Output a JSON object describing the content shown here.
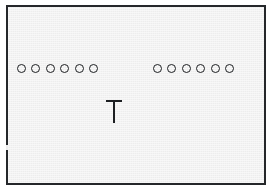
{
  "figure": {
    "background_color": "#ededed",
    "page_color": "#ffffff",
    "ink_color": "#1d1f22",
    "frame": {
      "border_color": "#25272a",
      "border_width_px": 2,
      "x": 6,
      "y": 5,
      "width": 260,
      "height": 180
    },
    "groups": [
      {
        "name": "left-group",
        "shape": "circle-outline",
        "count": 6,
        "x": 15,
        "y": 62,
        "diameter_px": 9,
        "spacing_px": 14.4,
        "items": [
          {
            "index": 1,
            "label": "o"
          },
          {
            "index": 2,
            "label": "o"
          },
          {
            "index": 3,
            "label": "o"
          },
          {
            "index": 4,
            "label": "o"
          },
          {
            "index": 5,
            "label": "o"
          },
          {
            "index": 6,
            "label": "o"
          }
        ]
      },
      {
        "name": "right-group",
        "shape": "circle-outline",
        "count": 6,
        "x": 151,
        "y": 62,
        "diameter_px": 9,
        "spacing_px": 14.4,
        "items": [
          {
            "index": 1,
            "label": "o"
          },
          {
            "index": 2,
            "label": "o"
          },
          {
            "index": 3,
            "label": "o"
          },
          {
            "index": 4,
            "label": "o"
          },
          {
            "index": 5,
            "label": "o"
          },
          {
            "index": 6,
            "label": "o"
          }
        ]
      }
    ],
    "gap": {
      "name": "center-gap",
      "x": 111,
      "width_px": 40
    },
    "probe": {
      "name": "t-probe",
      "glyph": "T",
      "x": 104,
      "y": 98,
      "width_px": 16,
      "height_px": 23,
      "stroke_px": 2.4
    }
  }
}
